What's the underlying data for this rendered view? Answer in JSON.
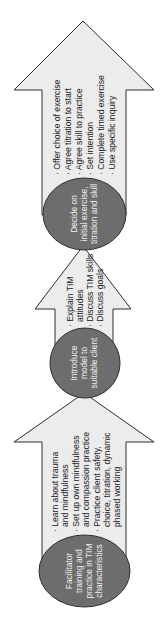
{
  "diagram": {
    "type": "vertical-process-flow",
    "orientation": "rotated-90-ccw",
    "colors": {
      "arrow_fill": "#ececec",
      "arrow_stroke": "#2e2e2e",
      "circle_fill": "#6d6d6d",
      "circle_text": "#f2f2f2",
      "bullet_text": "#222222"
    },
    "stages": [
      {
        "title_lines": [
          "Facilitator",
          "training and",
          "practice in TIM",
          "characteristics"
        ],
        "bullets": [
          [
            "Learn about trauma",
            "and mindfulness"
          ],
          [
            "Set up own mindfulness",
            "and compassion practice"
          ],
          [
            "Practice client safety,",
            "choice, titration, dynamic",
            "phased working"
          ]
        ]
      },
      {
        "title_lines": [
          "Introduce",
          "model to",
          "suitable client"
        ],
        "bullets": [
          [
            "Explain TIM",
            "attitudes"
          ],
          [
            "Discuss TIM skills"
          ],
          [
            "Discuss goals"
          ]
        ]
      },
      {
        "title_lines": [
          "Decide on",
          "initial exercise,",
          "titration and skill"
        ],
        "bullets": [
          [
            "Offer choice of exercise"
          ],
          [
            "Agree titration to start"
          ],
          [
            "Agree skill to practice"
          ],
          [
            "Set intention"
          ],
          [
            "Complete timed exercise"
          ],
          [
            "Use specific inquiry"
          ]
        ]
      }
    ]
  }
}
